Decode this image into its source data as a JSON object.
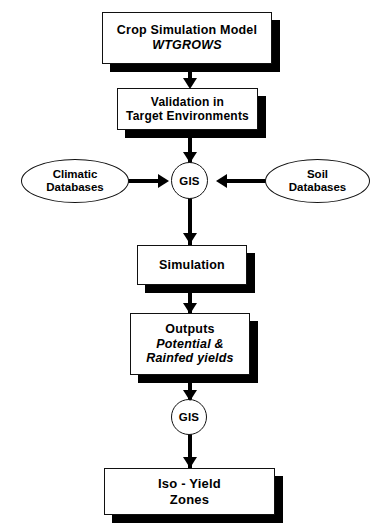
{
  "diagram": {
    "background_color": "#ffffff",
    "line_color": "#000000",
    "shadow_color": "#000000",
    "nodes": [
      {
        "id": "crop-simulation-model",
        "shape": "box",
        "lines": [
          {
            "text": "Crop Simulation Model",
            "style": "bold"
          },
          {
            "text": "WTGROWS",
            "style": "bold-italic"
          }
        ]
      },
      {
        "id": "validation",
        "shape": "box",
        "lines": [
          {
            "text": "Validation in",
            "style": "bold"
          },
          {
            "text": "Target Environments",
            "style": "bold"
          }
        ]
      },
      {
        "id": "climatic-databases",
        "shape": "ellipse",
        "lines": [
          {
            "text": "Climatic",
            "style": "bold"
          },
          {
            "text": "Databases",
            "style": "bold"
          }
        ]
      },
      {
        "id": "gis-top",
        "shape": "circle",
        "lines": [
          {
            "text": "GIS",
            "style": "bold"
          }
        ]
      },
      {
        "id": "soil-databases",
        "shape": "ellipse",
        "lines": [
          {
            "text": "Soil",
            "style": "bold"
          },
          {
            "text": "Databases",
            "style": "bold"
          }
        ]
      },
      {
        "id": "simulation",
        "shape": "box",
        "lines": [
          {
            "text": "Simulation",
            "style": "bold"
          }
        ]
      },
      {
        "id": "outputs",
        "shape": "box",
        "lines": [
          {
            "text": "Outputs",
            "style": "bold"
          },
          {
            "text": "Potential &",
            "style": "bold-italic"
          },
          {
            "text": "Rainfed yields",
            "style": "bold-italic"
          }
        ]
      },
      {
        "id": "gis-bottom",
        "shape": "circle",
        "lines": [
          {
            "text": "GIS",
            "style": "bold"
          }
        ]
      },
      {
        "id": "iso-yield-zones",
        "shape": "box",
        "lines": [
          {
            "text": "Iso - Yield",
            "style": "bold"
          },
          {
            "text": "Zones",
            "style": "bold"
          }
        ]
      }
    ],
    "edges": [
      {
        "from": "crop-simulation-model",
        "to": "validation",
        "direction": "down"
      },
      {
        "from": "validation",
        "to": "gis-top",
        "direction": "down"
      },
      {
        "from": "climatic-databases",
        "to": "gis-top",
        "direction": "right"
      },
      {
        "from": "soil-databases",
        "to": "gis-top",
        "direction": "left"
      },
      {
        "from": "gis-top",
        "to": "simulation",
        "direction": "down"
      },
      {
        "from": "simulation",
        "to": "outputs",
        "direction": "down"
      },
      {
        "from": "outputs",
        "to": "gis-bottom",
        "direction": "down"
      },
      {
        "from": "gis-bottom",
        "to": "iso-yield-zones",
        "direction": "down"
      }
    ]
  }
}
